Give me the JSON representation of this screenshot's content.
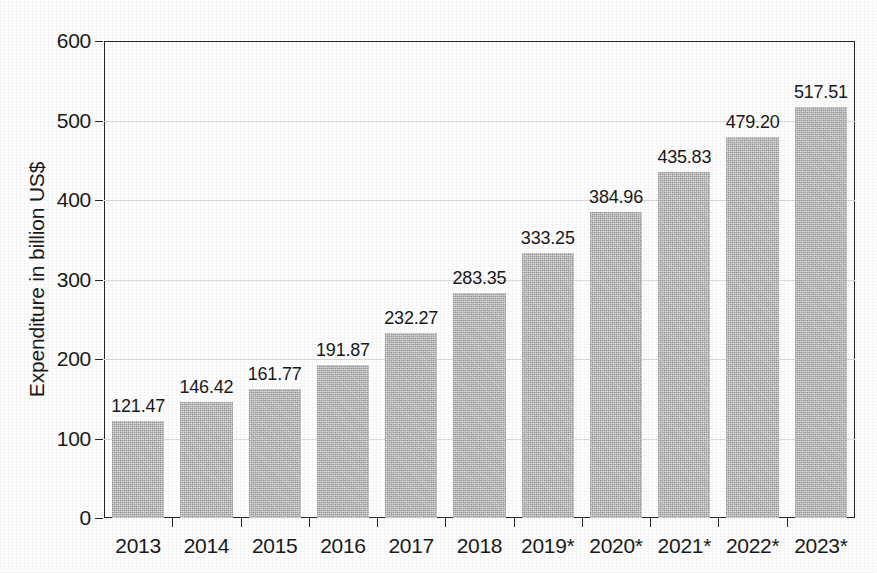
{
  "chart_data": {
    "type": "bar",
    "title": "",
    "subtitle": "",
    "xlabel": "",
    "ylabel": "Expenditure in billion US$",
    "ylim": [
      0,
      600
    ],
    "ytick_values": [
      0,
      100,
      200,
      300,
      400,
      500,
      600
    ],
    "ytick_labels": [
      "0",
      "100",
      "200",
      "300",
      "400",
      "500",
      "600"
    ],
    "grid": "horizontal",
    "legend": "none",
    "bar_color": "#b4b4b4",
    "categories": [
      "2013",
      "2014",
      "2015",
      "2016",
      "2017",
      "2018",
      "2019*",
      "2020*",
      "2021*",
      "2022*",
      "2023*"
    ],
    "values": [
      121.47,
      146.42,
      161.77,
      191.87,
      232.27,
      283.35,
      333.25,
      384.96,
      435.83,
      479.2,
      517.51
    ],
    "value_labels": [
      "121.47",
      "146.42",
      "161.77",
      "191.87",
      "232.27",
      "283.35",
      "333.25",
      "384.96",
      "435.83",
      "479.20",
      "517.51"
    ],
    "annotations": [
      "* denotes forecast values"
    ]
  }
}
